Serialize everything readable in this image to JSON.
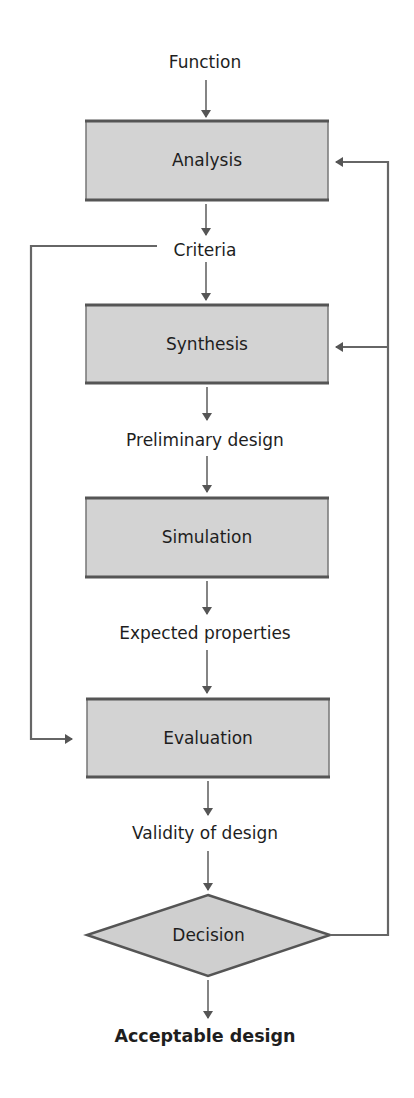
{
  "diagram": {
    "type": "flowchart",
    "colors": {
      "box_fill": "#d3d3d3",
      "box_border": "#555555",
      "line": "#666666",
      "text": "#1e1e1e"
    },
    "labels": {
      "function": "Function",
      "criteria": "Criteria",
      "preliminary_design": "Preliminary design",
      "expected_properties": "Expected properties",
      "validity_of_design": "Validity of design",
      "acceptable_design": "Acceptable design"
    },
    "process_boxes": [
      {
        "id": "analysis",
        "label": "Analysis"
      },
      {
        "id": "synthesis",
        "label": "Synthesis"
      },
      {
        "id": "simulation",
        "label": "Simulation"
      },
      {
        "id": "evaluation",
        "label": "Evaluation"
      }
    ],
    "decision": {
      "id": "decision",
      "label": "Decision"
    },
    "edges": [
      {
        "from": "Function",
        "to": "Analysis"
      },
      {
        "from": "Analysis",
        "to": "Criteria"
      },
      {
        "from": "Criteria",
        "to": "Synthesis"
      },
      {
        "from": "Criteria",
        "to": "Evaluation",
        "route": "left-loop"
      },
      {
        "from": "Synthesis",
        "to": "Preliminary design"
      },
      {
        "from": "Preliminary design",
        "to": "Simulation"
      },
      {
        "from": "Simulation",
        "to": "Expected properties"
      },
      {
        "from": "Expected properties",
        "to": "Evaluation"
      },
      {
        "from": "Evaluation",
        "to": "Validity of design"
      },
      {
        "from": "Validity of design",
        "to": "Decision"
      },
      {
        "from": "Decision",
        "to": "Acceptable design"
      },
      {
        "from": "Decision",
        "to": "Analysis",
        "route": "right-feedback"
      },
      {
        "from": "Decision",
        "to": "Synthesis",
        "route": "right-feedback"
      }
    ]
  }
}
